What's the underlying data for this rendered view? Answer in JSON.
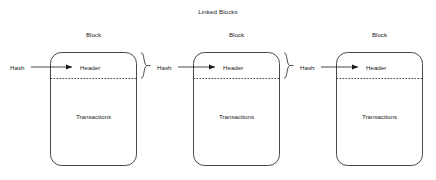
{
  "diagram": {
    "title": "Linked Blocks",
    "type": "blockchain-linked-blocks",
    "background_color": "#ffffff",
    "stroke_color": "#1a1a1a",
    "text_color": "#1a1a1a",
    "blocks": [
      {
        "caption": "Block",
        "header_label": "Header",
        "transactions_label": "Transactions",
        "incoming_hash_label": "Hash",
        "outgoing_hash_bracket": true
      },
      {
        "caption": "Block",
        "header_label": "Header",
        "transactions_label": "Transactions",
        "incoming_hash_label": "Hash",
        "outgoing_hash_bracket": true
      },
      {
        "caption": "Block",
        "header_label": "Header",
        "transactions_label": "Transactions",
        "incoming_hash_label": "Hash",
        "outgoing_hash_bracket": false
      }
    ]
  }
}
